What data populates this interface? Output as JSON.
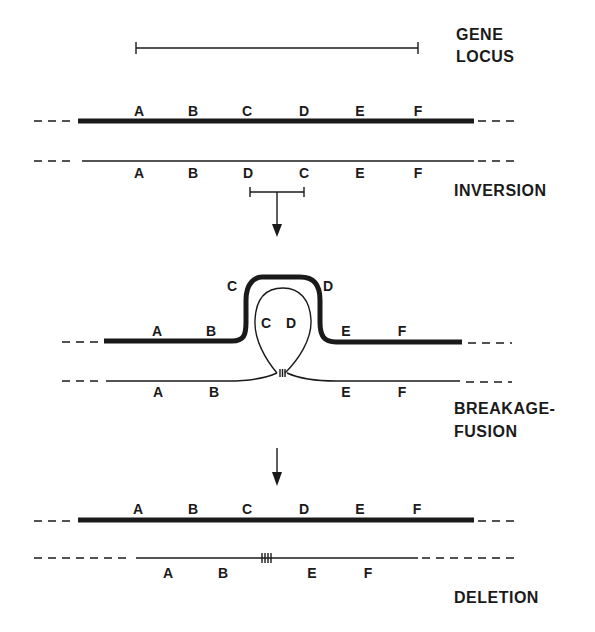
{
  "stages": {
    "gene_locus": {
      "line1": "GENE",
      "line2": "LOCUS"
    },
    "inversion": "INVERSION",
    "breakage_fusion": {
      "line1": "BREAKAGE-",
      "line2": "FUSION"
    },
    "deletion": "DELETION"
  },
  "rows": {
    "normal_top": [
      "A",
      "B",
      "C",
      "D",
      "E",
      "F"
    ],
    "inverted": [
      "A",
      "B",
      "D",
      "C",
      "E",
      "F"
    ],
    "loop_thick": {
      "left": [
        "A",
        "B"
      ],
      "arc": [
        "C",
        "D"
      ],
      "right": [
        "E",
        "F"
      ]
    },
    "loop_inner": [
      "C",
      "D"
    ],
    "loop_thin": [
      "A",
      "B",
      "E",
      "F"
    ],
    "final_normal": [
      "A",
      "B",
      "C",
      "D",
      "E",
      "F"
    ],
    "deleted": [
      "A",
      "B",
      "E",
      "F"
    ]
  },
  "colors": {
    "ink": "#1a1a1a",
    "background": "#ffffff"
  }
}
